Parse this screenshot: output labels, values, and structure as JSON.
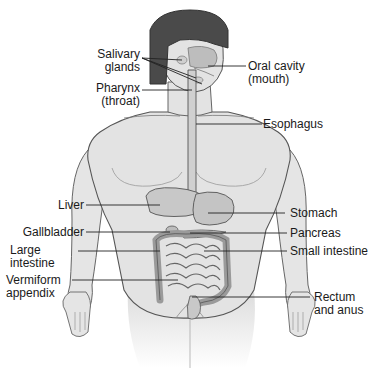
{
  "diagram": {
    "labels": {
      "salivary_glands": "Salivary\nglands",
      "oral_cavity": "Oral cavity\n(mouth)",
      "pharynx": "Pharynx\n(throat)",
      "esophagus": "Esophagus",
      "liver": "Liver",
      "stomach": "Stomach",
      "gallbladder": "Gallbladder",
      "pancreas": "Pancreas",
      "large_intestine": "Large\nintestine",
      "small_intestine": "Small intestine",
      "vermiform_appendix": "Vermiform\nappendix",
      "rectum_anus": "Rectum\nand anus"
    },
    "colors": {
      "skin": "#e3e3e3",
      "outline": "#555555",
      "hair": "#4a4a4a",
      "organ": "#c8c8c8",
      "leader_line": "#222222",
      "text": "#1a1a1a"
    }
  }
}
